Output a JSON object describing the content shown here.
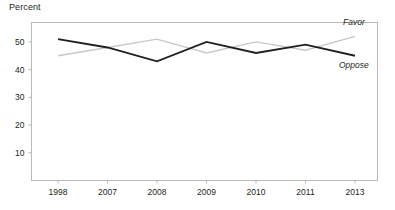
{
  "chart_data": {
    "type": "line",
    "title": "",
    "ylabel": "Percent",
    "xlabel": "",
    "categories": [
      "1998",
      "2007",
      "2008",
      "2009",
      "2010",
      "2011",
      "2013"
    ],
    "series": [
      {
        "name": "Favor",
        "color": "#c8c8c8",
        "values": [
          45,
          48,
          51,
          46,
          50,
          47,
          52
        ]
      },
      {
        "name": "Oppose",
        "color": "#231f20",
        "values": [
          51,
          48,
          43,
          50,
          46,
          49,
          45
        ]
      }
    ],
    "ylim": [
      0,
      57
    ],
    "yticks": [
      10,
      20,
      30,
      40,
      50
    ],
    "ytick_labels": [
      "10",
      "20",
      "30",
      "40",
      "50"
    ],
    "xtick_labels": [
      "1998",
      "2007",
      "2008",
      "2009",
      "2010",
      "2011",
      "2013"
    ],
    "grid": false,
    "legend_position": "inline-right"
  },
  "labels": {
    "axis_title": "Percent",
    "favor": "Favor",
    "oppose": "Oppose"
  }
}
